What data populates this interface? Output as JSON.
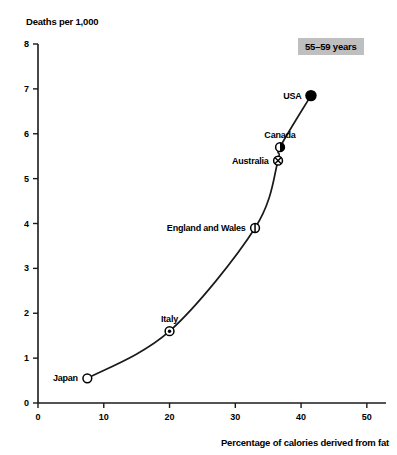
{
  "chart_data": {
    "type": "scatter",
    "title": "",
    "annotation_badge": "55–59 years",
    "xlabel": "Percentage of calories derived from fat",
    "ylabel": "Deaths per 1,000",
    "xlim": [
      0,
      52
    ],
    "ylim": [
      0,
      8
    ],
    "xticks": [
      0,
      10,
      20,
      30,
      40,
      50
    ],
    "xticklabels": [
      "0",
      "10",
      "20",
      "30",
      "40",
      "50"
    ],
    "yticks": [
      0,
      1,
      2,
      3,
      4,
      5,
      6,
      7,
      8
    ],
    "yticklabels": [
      "0",
      "1",
      "2",
      "3",
      "4",
      "5",
      "6",
      "7",
      "8"
    ],
    "grid": false,
    "legend": "none",
    "trendline": true,
    "points": [
      {
        "label": "Japan",
        "x": 7.5,
        "y": 0.55,
        "marker": "open-circle",
        "label_position": "left"
      },
      {
        "label": "Italy",
        "x": 20.0,
        "y": 1.6,
        "marker": "dot-in-circle",
        "label_position": "above"
      },
      {
        "label": "England and Wales",
        "x": 33.0,
        "y": 3.9,
        "marker": "vertical-bar-circle",
        "label_position": "left"
      },
      {
        "label": "Australia",
        "x": 36.5,
        "y": 5.4,
        "marker": "cross-circle",
        "label_position": "left"
      },
      {
        "label": "Canada",
        "x": 36.8,
        "y": 5.7,
        "marker": "half-filled-circle",
        "label_position": "above"
      },
      {
        "label": "USA",
        "x": 41.5,
        "y": 6.85,
        "marker": "filled-circle",
        "label_position": "left"
      }
    ]
  },
  "style": {
    "badge_background": "#bfbfbf",
    "axis_color": "#1a1a1a",
    "curve_color": "#1a1a1a",
    "marker_color": "#000000",
    "background": "#ffffff"
  }
}
